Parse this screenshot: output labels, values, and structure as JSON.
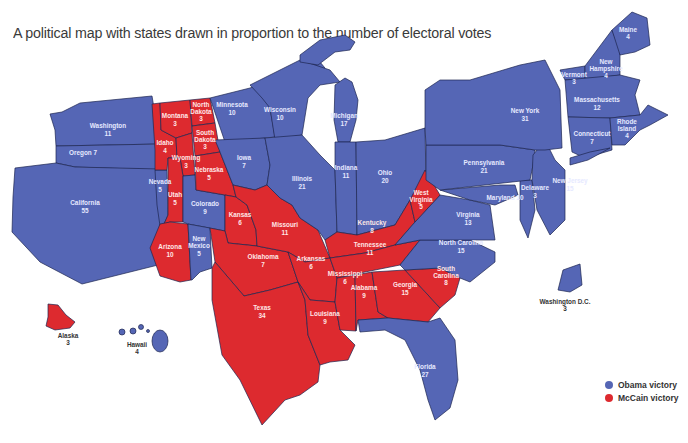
{
  "title": "A political map with states drawn in proportion to the number of electoral votes",
  "colors": {
    "obama": "#5566b5",
    "mccain": "#dd2a2f"
  },
  "legend": [
    {
      "label": "Obama victory",
      "color": "#5566b5"
    },
    {
      "label": "McCain victory",
      "color": "#dd2a2f"
    }
  ],
  "states": [
    {
      "name": "Washington",
      "ev": "11",
      "winner": "obama"
    },
    {
      "name": "Oregon",
      "ev": "7",
      "winner": "obama"
    },
    {
      "name": "California",
      "ev": "55",
      "winner": "obama"
    },
    {
      "name": "Nevada",
      "ev": "5",
      "winner": "obama"
    },
    {
      "name": "Idaho",
      "ev": "4",
      "winner": "mccain"
    },
    {
      "name": "Montana",
      "ev": "3",
      "winner": "mccain"
    },
    {
      "name": "Wyoming",
      "ev": "3",
      "winner": "mccain"
    },
    {
      "name": "Utah",
      "ev": "5",
      "winner": "mccain"
    },
    {
      "name": "Arizona",
      "ev": "10",
      "winner": "mccain"
    },
    {
      "name": "Colorado",
      "ev": "9",
      "winner": "obama"
    },
    {
      "name": "New Mexico",
      "ev": "5",
      "winner": "obama"
    },
    {
      "name": "North Dakota",
      "ev": "3",
      "winner": "mccain"
    },
    {
      "name": "South Dakota",
      "ev": "3",
      "winner": "mccain"
    },
    {
      "name": "Nebraska",
      "ev": "5",
      "winner": "mccain"
    },
    {
      "name": "Kansas",
      "ev": "6",
      "winner": "mccain"
    },
    {
      "name": "Oklahoma",
      "ev": "7",
      "winner": "mccain"
    },
    {
      "name": "Texas",
      "ev": "34",
      "winner": "mccain"
    },
    {
      "name": "Minnesota",
      "ev": "10",
      "winner": "obama"
    },
    {
      "name": "Iowa",
      "ev": "7",
      "winner": "obama"
    },
    {
      "name": "Missouri",
      "ev": "11",
      "winner": "mccain"
    },
    {
      "name": "Arkansas",
      "ev": "6",
      "winner": "mccain"
    },
    {
      "name": "Louisiana",
      "ev": "9",
      "winner": "mccain"
    },
    {
      "name": "Wisconsin",
      "ev": "10",
      "winner": "obama"
    },
    {
      "name": "Illinois",
      "ev": "21",
      "winner": "obama"
    },
    {
      "name": "Michigan",
      "ev": "17",
      "winner": "obama"
    },
    {
      "name": "Indiana",
      "ev": "11",
      "winner": "obama"
    },
    {
      "name": "Ohio",
      "ev": "20",
      "winner": "obama"
    },
    {
      "name": "Kentucky",
      "ev": "8",
      "winner": "mccain"
    },
    {
      "name": "Tennessee",
      "ev": "11",
      "winner": "mccain"
    },
    {
      "name": "Mississippi",
      "ev": "6",
      "winner": "mccain"
    },
    {
      "name": "Alabama",
      "ev": "9",
      "winner": "mccain"
    },
    {
      "name": "Georgia",
      "ev": "15",
      "winner": "mccain"
    },
    {
      "name": "Florida",
      "ev": "27",
      "winner": "obama"
    },
    {
      "name": "South Carolina",
      "ev": "8",
      "winner": "mccain"
    },
    {
      "name": "North Carolina",
      "ev": "15",
      "winner": "obama"
    },
    {
      "name": "Virginia",
      "ev": "13",
      "winner": "obama"
    },
    {
      "name": "West Virginia",
      "ev": "5",
      "winner": "mccain"
    },
    {
      "name": "Maryland",
      "ev": "10",
      "winner": "obama"
    },
    {
      "name": "Delaware",
      "ev": "3",
      "winner": "obama"
    },
    {
      "name": "Pennsylvania",
      "ev": "21",
      "winner": "obama"
    },
    {
      "name": "New Jersey",
      "ev": "15",
      "winner": "obama"
    },
    {
      "name": "New York",
      "ev": "31",
      "winner": "obama"
    },
    {
      "name": "Vermont",
      "ev": "3",
      "winner": "obama"
    },
    {
      "name": "New Hampshire",
      "ev": "4",
      "winner": "obama"
    },
    {
      "name": "Maine",
      "ev": "4",
      "winner": "obama"
    },
    {
      "name": "Massachusetts",
      "ev": "12",
      "winner": "obama"
    },
    {
      "name": "Connecticut",
      "ev": "7",
      "winner": "obama"
    },
    {
      "name": "Rhode Island",
      "ev": "4",
      "winner": "obama"
    },
    {
      "name": "Washington D.C.",
      "ev": "3",
      "winner": "obama"
    },
    {
      "name": "Alaska",
      "ev": "3",
      "winner": "mccain"
    },
    {
      "name": "Hawaii",
      "ev": "4",
      "winner": "obama"
    }
  ],
  "labels": {
    "Washington": "Washington",
    "Oregon": "Oregon 7",
    "California": "California",
    "Nevada": "Nevada",
    "Idaho": "Idaho",
    "Montana": "Montana",
    "Wyoming": "Wyoming",
    "Utah": "Utah",
    "Arizona": "Arizona",
    "Colorado": "Colorado",
    "NewMexico1": "New",
    "NewMexico2": "Mexico",
    "NorthDakota1": "North",
    "NorthDakota2": "Dakota",
    "SouthDakota1": "South",
    "SouthDakota2": "Dakota",
    "Nebraska": "Nebraska",
    "Kansas": "Kansas",
    "Oklahoma": "Oklahoma",
    "Texas": "Texas",
    "Minnesota": "Minnesota",
    "Iowa": "Iowa",
    "Missouri": "Missouri",
    "Arkansas": "Arkansas",
    "Louisiana": "Louisiana",
    "Wisconsin": "Wisconsin",
    "Illinois": "Illinois",
    "Michigan": "Michigan",
    "Indiana": "Indiana",
    "Ohio": "Ohio",
    "Kentucky": "Kentucky",
    "Tennessee": "Tennessee",
    "Mississippi": "Mississippi",
    "Alabama": "Alabama",
    "Georgia": "Georgia",
    "Florida": "Florida",
    "SouthCarolina1": "South",
    "SouthCarolina2": "Carolina",
    "NorthCarolina": "North Carolina",
    "Virginia": "Virginia",
    "WestVirginia1": "West",
    "WestVirginia2": "Virginia",
    "Maryland": "Maryland 10",
    "Delaware": "Delaware",
    "Pennsylvania": "Pennsylvania",
    "NewJersey": "New Jersey",
    "NewYork": "New York",
    "Vermont": "Vermont",
    "NewHampshire1": "New",
    "NewHampshire2": "Hampshire",
    "Maine": "Maine",
    "Massachusetts": "Massachusetts",
    "Connecticut": "Connecticut",
    "RhodeIsland1": "Rhode",
    "RhodeIsland2": "Island",
    "DC": "Washington D.C.",
    "Alaska": "Alaska",
    "Hawaii": "Hawaii"
  }
}
